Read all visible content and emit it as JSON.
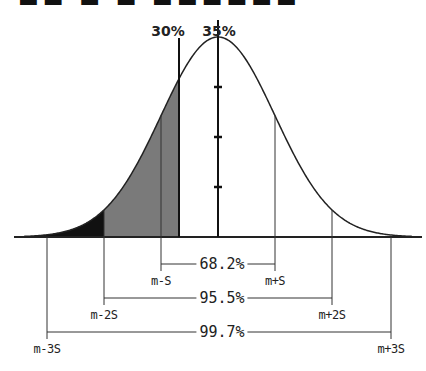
{
  "figure": {
    "title_clipped": "■■ ■ ■ ■■■■■■",
    "mean_label": "35%",
    "threshold_label": "30%"
  },
  "chart_data": {
    "type": "area",
    "title": "",
    "distribution": {
      "mean": "m",
      "sd": "S"
    },
    "annotations": {
      "mean_value": "35%",
      "threshold_value": "30%"
    },
    "intervals": [
      {
        "label": "68.2%",
        "low": "m-S",
        "high": "m+S"
      },
      {
        "label": "95.5%",
        "low": "m-2S",
        "high": "m+2S"
      },
      {
        "label": "99.7%",
        "low": "m-3S",
        "high": "m+3S"
      }
    ],
    "shaded_regions": [
      {
        "from": "-inf",
        "to": "m-2S",
        "fill": "#111111"
      },
      {
        "from": "m-2S",
        "to": "30%",
        "fill": "#7a7a7a"
      }
    ],
    "mean_axis_ticks": 3,
    "geometry": {
      "mean_x": 218,
      "sigma_px": 57,
      "baseline_y": 237,
      "peak_height": 200,
      "threshold_x": 179,
      "x_start": 14,
      "x_end": 422
    },
    "colors": {
      "line": "#222222",
      "dark_fill": "#111111",
      "gray_fill": "#7a7a7a"
    }
  }
}
